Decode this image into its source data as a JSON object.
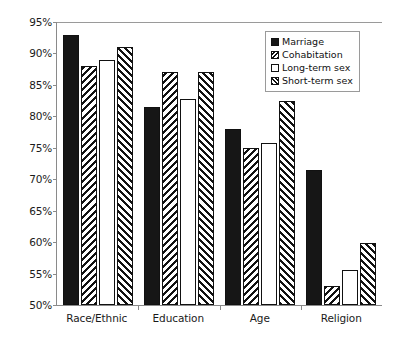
{
  "chart_data": {
    "type": "bar",
    "title": "",
    "xlabel": "",
    "ylabel": "",
    "ylim": [
      50,
      95
    ],
    "ytick_step": 5,
    "grid": false,
    "legend_position": "top-right",
    "categories": [
      "Race/Ethnic",
      "Education",
      "Age",
      "Religion"
    ],
    "ytick_labels": [
      "95%",
      "90%",
      "85%",
      "80%",
      "75%",
      "70%",
      "65%",
      "60%",
      "55%",
      "50%"
    ],
    "ytick_values": [
      95,
      90,
      85,
      80,
      75,
      70,
      65,
      60,
      55,
      50
    ],
    "series": [
      {
        "name": "Marriage",
        "fill": "solid-black",
        "color": "#161616",
        "values": [
          93.0,
          81.5,
          78.0,
          71.5
        ]
      },
      {
        "name": "Cohabitation",
        "fill": "backslash-hatch",
        "color": "#111111",
        "values": [
          88.0,
          87.0,
          75.0,
          53.0
        ]
      },
      {
        "name": "Long-term sex",
        "fill": "white-empty",
        "color": "#ffffff",
        "values": [
          89.0,
          82.8,
          75.7,
          55.5
        ]
      },
      {
        "name": "Short-term sex",
        "fill": "forwardslash-hatch",
        "color": "#111111",
        "values": [
          91.0,
          87.0,
          82.5,
          59.8
        ]
      }
    ]
  },
  "colors": {
    "axis": "#8a8a8a",
    "bar_outline": "#111111",
    "text": "#1a1a1a",
    "background": "#ffffff"
  }
}
